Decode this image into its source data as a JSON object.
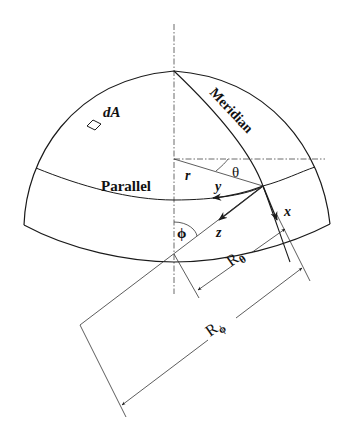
{
  "diagram": {
    "type": "shell-of-revolution-geometry",
    "labels": {
      "area_element": "dA",
      "meridian": "Meridian",
      "parallel": "Parallel",
      "radius_r": "r",
      "angle_theta": "θ",
      "angle_phi": "ϕ",
      "axis_x": "x",
      "axis_y": "y",
      "axis_z": "z",
      "radius_theta_main": "R",
      "radius_theta_sub": "θ",
      "radius_phi_main": "R",
      "radius_phi_sub": "ϕ"
    },
    "colors": {
      "stroke": "#1a1a1a",
      "background": "#ffffff"
    }
  }
}
